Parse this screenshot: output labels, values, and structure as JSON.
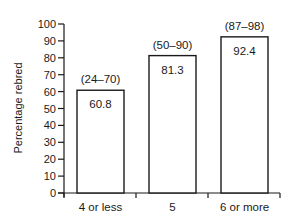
{
  "chart_data": {
    "type": "bar",
    "title": "",
    "xlabel": "",
    "ylabel": "Percentage rebred",
    "ylim": [
      0,
      100
    ],
    "yticks": [
      0,
      10,
      20,
      30,
      40,
      50,
      60,
      70,
      80,
      90,
      100
    ],
    "grid": false,
    "legend": null,
    "categories": [
      "4 or less",
      "5",
      "6 or more"
    ],
    "values": [
      60.8,
      81.3,
      92.4
    ],
    "range_annotations": [
      "(24–70)",
      "(50–90)",
      "(87–98)"
    ],
    "bar_fill": "#ffffff",
    "bar_stroke": "#1a1a1a"
  }
}
